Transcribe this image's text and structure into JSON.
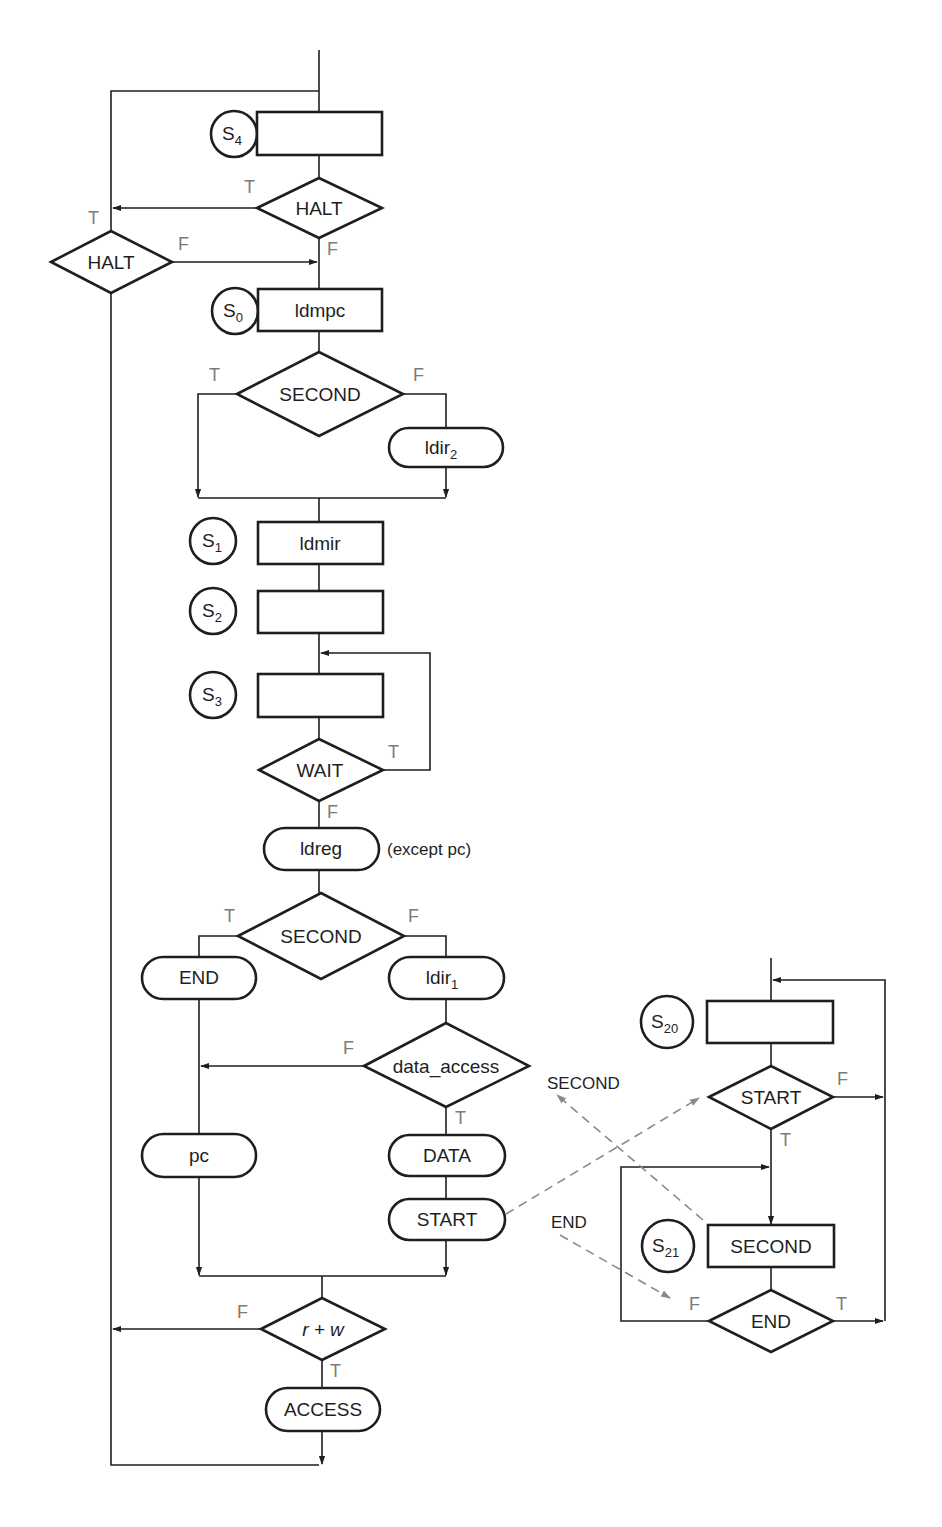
{
  "diagram": {
    "type": "state-machine-flowchart",
    "colors": {
      "stroke": "#1e1e1e",
      "branch_label": "#7a7a7a",
      "dashed_link": "#8a8a8a",
      "background": "#ffffff"
    },
    "main_flow": {
      "states": [
        {
          "id": "S4",
          "base": "S",
          "sub": "4",
          "box_label": ""
        },
        {
          "id": "S0",
          "base": "S",
          "sub": "0",
          "box_label": "ldmpc"
        },
        {
          "id": "S1",
          "base": "S",
          "sub": "1",
          "box_label": "ldmir"
        },
        {
          "id": "S2",
          "base": "S",
          "sub": "2",
          "box_label": ""
        },
        {
          "id": "S3",
          "base": "S",
          "sub": "3",
          "box_label": ""
        }
      ],
      "decisions": {
        "halt_main": {
          "label": "HALT",
          "true": "T",
          "false": "F"
        },
        "halt_side": {
          "label": "HALT",
          "true": "T",
          "false": "F"
        },
        "second_1": {
          "label": "SECOND",
          "true": "T",
          "false": "F"
        },
        "wait": {
          "label": "WAIT",
          "true": "T",
          "false": "F"
        },
        "second_2": {
          "label": "SECOND",
          "true": "T",
          "false": "F"
        },
        "data_access": {
          "label": "data_access",
          "true": "T",
          "false": "F"
        },
        "r_plus_w": {
          "label": "r + w",
          "true": "T",
          "false": "F"
        }
      },
      "outputs": {
        "ldir2": {
          "base": "ldir",
          "sub": "2"
        },
        "ldreg": {
          "label": "ldreg",
          "note": "(except pc)"
        },
        "end": {
          "label": "END"
        },
        "ldir1": {
          "base": "ldir",
          "sub": "1"
        },
        "pc": {
          "label": "pc"
        },
        "data": {
          "label": "DATA"
        },
        "start": {
          "label": "START"
        },
        "access": {
          "label": "ACCESS"
        }
      }
    },
    "sub_flow": {
      "states": [
        {
          "id": "S20",
          "base": "S",
          "sub": "20",
          "box_label": ""
        },
        {
          "id": "S21",
          "base": "S",
          "sub": "21",
          "box_label": "SECOND"
        }
      ],
      "decisions": {
        "start": {
          "label": "START",
          "true": "T",
          "false": "F"
        },
        "end": {
          "label": "END",
          "true": "T",
          "false": "F"
        }
      }
    },
    "signal_links": [
      {
        "label": "SECOND",
        "from": "S21",
        "to": "data_access region"
      },
      {
        "label": "START",
        "from": "START output",
        "to": "START decision"
      },
      {
        "label": "END",
        "from": "END label",
        "to": "END decision (F side)"
      }
    ]
  }
}
